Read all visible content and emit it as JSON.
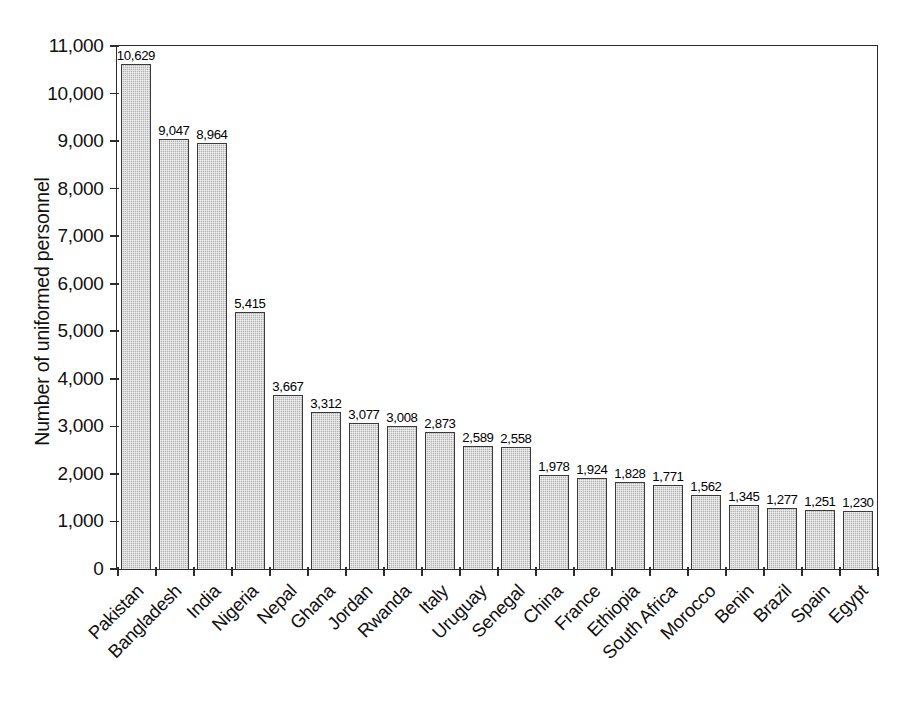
{
  "chart_data": {
    "type": "bar",
    "title": "",
    "subtitle": "",
    "xlabel": "",
    "ylabel": "Number of uniformed personnel",
    "ylim": [
      0,
      11000
    ],
    "ytick_labels": [
      "0",
      "1,000",
      "2,000",
      "3,000",
      "4,000",
      "5,000",
      "6,000",
      "7,000",
      "8,000",
      "9,000",
      "10,000",
      "11,000"
    ],
    "ytick_values": [
      0,
      1000,
      2000,
      3000,
      4000,
      5000,
      6000,
      7000,
      8000,
      9000,
      10000,
      11000
    ],
    "grid": false,
    "legend": false,
    "legend_position": "none",
    "bar_color": "#b4b4b4",
    "bar_edge_color": "#3a3a3a",
    "categories": [
      "Pakistan",
      "Bangladesh",
      "India",
      "Nigeria",
      "Nepal",
      "Ghana",
      "Jordan",
      "Rwanda",
      "Italy",
      "Uruguay",
      "Senegal",
      "China",
      "France",
      "Ethiopia",
      "South Africa",
      "Morocco",
      "Benin",
      "Brazil",
      "Spain",
      "Egypt"
    ],
    "values": [
      10629,
      9047,
      8964,
      5415,
      3667,
      3312,
      3077,
      3008,
      2873,
      2589,
      2558,
      1978,
      1924,
      1828,
      1771,
      1562,
      1345,
      1277,
      1251,
      1230
    ],
    "value_labels": [
      "10,629",
      "9,047",
      "8,964",
      "5,415",
      "3,667",
      "3,312",
      "3,077",
      "3,008",
      "2,873",
      "2,589",
      "2,558",
      "1,978",
      "1,924",
      "1,828",
      "1,771",
      "1,562",
      "1,345",
      "1,277",
      "1,251",
      "1,230"
    ]
  }
}
